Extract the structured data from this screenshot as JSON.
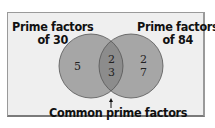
{
  "diagram": {
    "type": "venn",
    "left_set": {
      "label_line1": "Prime factors",
      "label_line2": "of 30",
      "unique_elements": [
        "5"
      ]
    },
    "right_set": {
      "label_line1": "Prime factors",
      "label_line2": "of 84",
      "unique_elements": [
        "2",
        "7"
      ]
    },
    "intersection": {
      "elements": [
        "2",
        "3"
      ],
      "label": "Common prime factors"
    },
    "colors": {
      "background": "#efefef",
      "circle_fill": "#a6a6a6",
      "intersection_fill": "#8c8c8c",
      "circle_stroke": "#555555",
      "frame_border": "#9a9a9a"
    }
  }
}
